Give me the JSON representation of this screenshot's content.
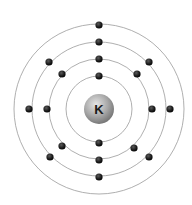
{
  "diagram": {
    "type": "bohr-atomic-model",
    "element_symbol": "K",
    "center": [
      99,
      109
    ],
    "nucleus": {
      "radius": 15,
      "color_light": "#e6e6e6",
      "color_mid": "#a9a9a9",
      "color_dark": "#6f6f6f",
      "label_color": "#1a1a1a"
    },
    "orbit_color": "#9a9a9a",
    "electron_color": "#1c1c1c",
    "electron_radius": 3.6,
    "shells": [
      {
        "name": "shell-1",
        "radius": 33,
        "electron_count": 2,
        "electrons": [
          [
            99,
            76
          ],
          [
            99,
            143
          ]
        ]
      },
      {
        "name": "shell-2",
        "radius": 50,
        "electron_count": 8,
        "electrons": [
          [
            99,
            59
          ],
          [
            137,
            74
          ],
          [
            152,
            109
          ],
          [
            134,
            148
          ],
          [
            99,
            160
          ],
          [
            62,
            146
          ],
          [
            47,
            109
          ],
          [
            62,
            74
          ]
        ]
      },
      {
        "name": "shell-3",
        "radius": 67,
        "electron_count": 8,
        "electrons": [
          [
            99,
            42
          ],
          [
            149,
            62
          ],
          [
            170,
            109
          ],
          [
            149,
            157
          ],
          [
            99,
            177
          ],
          [
            50,
            157
          ],
          [
            29,
            109
          ],
          [
            49,
            62
          ]
        ]
      },
      {
        "name": "shell-4",
        "radius": 85,
        "electron_count": 1,
        "electrons": [
          [
            99,
            25
          ]
        ]
      }
    ]
  }
}
